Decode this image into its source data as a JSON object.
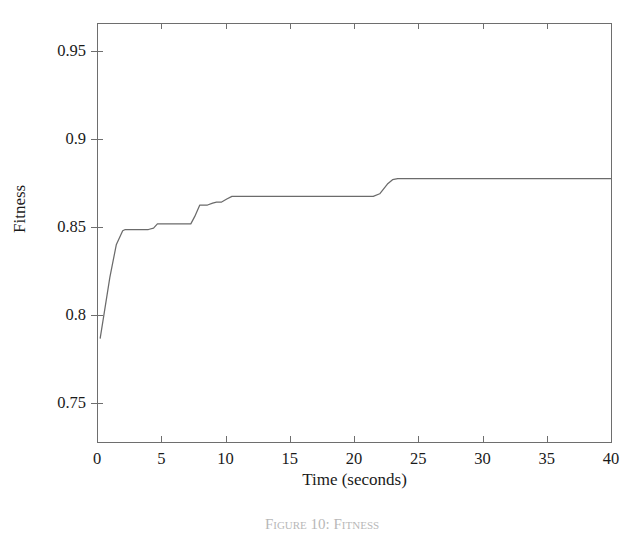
{
  "figure": {
    "caption": "Figure 10:  Fitness",
    "background_color": "#ffffff",
    "line_color": "#6b6b6b",
    "axis_color": "#6e6e6e"
  },
  "chart_data": {
    "type": "line",
    "title": "",
    "xlabel": "Time (seconds)",
    "ylabel": "Fitness",
    "xlim": [
      0,
      40
    ],
    "ylim": [
      0.728,
      0.966
    ],
    "xticks": [
      0,
      5,
      10,
      15,
      20,
      25,
      30,
      35,
      40
    ],
    "xticklabels": [
      "0",
      "5",
      "10",
      "15",
      "20",
      "25",
      "30",
      "35",
      "40"
    ],
    "yticks": [
      0.75,
      0.8,
      0.85,
      0.9,
      0.95
    ],
    "yticklabels": [
      "0.75",
      "0.8",
      "0.85",
      "0.9",
      "0.95"
    ],
    "grid": false,
    "legend": false,
    "series": [
      {
        "name": "fitness",
        "x": [
          0.25,
          0.5,
          1.0,
          1.5,
          2.0,
          2.2,
          3.0,
          4.0,
          4.4,
          4.7,
          5.5,
          6.5,
          7.3,
          7.6,
          8.0,
          8.6,
          9.0,
          9.3,
          9.7,
          10.1,
          10.5,
          11.0,
          13.0,
          16.0,
          19.0,
          21.5,
          22.0,
          22.6,
          23.0,
          23.4,
          25.0,
          28.0,
          31.0,
          34.0,
          37.0,
          40.0
        ],
        "y": [
          0.787,
          0.7985,
          0.8215,
          0.84,
          0.848,
          0.8487,
          0.8487,
          0.8487,
          0.8495,
          0.8519,
          0.8519,
          0.8519,
          0.8519,
          0.856,
          0.8626,
          0.8626,
          0.8637,
          0.8643,
          0.8643,
          0.866,
          0.8675,
          0.8675,
          0.8675,
          0.8675,
          0.8675,
          0.8675,
          0.869,
          0.8745,
          0.877,
          0.8776,
          0.8776,
          0.8776,
          0.8776,
          0.8776,
          0.8776,
          0.8776
        ]
      }
    ]
  }
}
